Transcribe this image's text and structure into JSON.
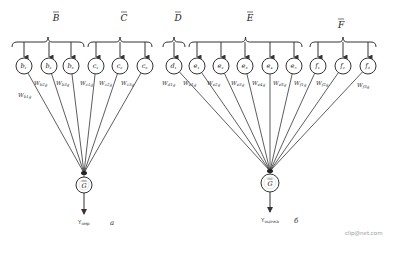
{
  "panels": [
    {
      "id": "a",
      "panel_label": "а",
      "groups": [
        {
          "label": "B",
          "brace": [
            12,
            84
          ],
          "label_x": 56,
          "label_y": 21,
          "nodes": [
            {
              "label": "b₁",
              "x": 24,
              "weight": "W_b1g",
              "wx": 18,
              "wy": 97
            },
            {
              "label": "b₂",
              "x": 49,
              "weight": "W_b2g",
              "wx": 34,
              "wy": 85
            },
            {
              "label": "b₃",
              "x": 71,
              "weight": "W_b3g",
              "wx": 56,
              "wy": 85
            }
          ]
        },
        {
          "label": "C",
          "brace": [
            88,
            152
          ],
          "label_x": 124,
          "label_y": 21,
          "nodes": [
            {
              "label": "c₁",
              "x": 96,
              "weight": "W_c1g",
              "wx": 80,
              "wy": 85
            },
            {
              "label": "c₂",
              "x": 120,
              "weight": "W_c2g",
              "wx": 99,
              "wy": 85
            },
            {
              "label": "c₃",
              "x": 145,
              "weight": "W_c3g",
              "wx": 121,
              "wy": 85
            }
          ]
        }
      ],
      "target": {
        "label": "G",
        "x": 84,
        "y": 185,
        "r": 8,
        "converge_y": 173
      },
      "output": {
        "label": "Y_омр",
        "x": 78,
        "y": 224
      },
      "panel_x": 110,
      "panel_y": 225
    },
    {
      "id": "b",
      "panel_label": "б",
      "groups": [
        {
          "label": "D",
          "brace": [
            163,
            185
          ],
          "label_x": 178,
          "label_y": 21,
          "nodes": [
            {
              "label": "d₁",
              "x": 174,
              "weight": "W_d1g",
              "wx": 162,
              "wy": 85
            }
          ]
        },
        {
          "label": "E",
          "brace": [
            189,
            302
          ],
          "label_x": 250,
          "label_y": 21,
          "nodes": [
            {
              "label": "e₁",
              "x": 197,
              "weight": "W_e1g",
              "wx": 183,
              "wy": 85
            },
            {
              "label": "e₂",
              "x": 221,
              "weight": "W_e2g",
              "wx": 207,
              "wy": 85
            },
            {
              "label": "e₃",
              "x": 245,
              "weight": "W_e3g",
              "wx": 231,
              "wy": 85
            },
            {
              "label": "e₄",
              "x": 270,
              "weight": "W_e4g",
              "wx": 252,
              "wy": 85
            },
            {
              "label": "e₅",
              "x": 294,
              "weight": "W_e5g",
              "wx": 273,
              "wy": 85
            }
          ]
        },
        {
          "label": "F",
          "brace": [
            310,
            376
          ],
          "label_x": 341,
          "label_y": 28,
          "nodes": [
            {
              "label": "f₁",
              "x": 318,
              "weight": "W_f1g",
              "wx": 294,
              "wy": 85
            },
            {
              "label": "f₂",
              "x": 343,
              "weight": "W_f2g",
              "wx": 316,
              "wy": 85
            },
            {
              "label": "f₃",
              "x": 368,
              "weight": "W_f3g",
              "wx": 357,
              "wy": 87
            }
          ]
        }
      ],
      "target": {
        "label": "G",
        "x": 270,
        "y": 183,
        "r": 9,
        "converge_y": 171
      },
      "output": {
        "label": "Y_оцінка",
        "x": 261,
        "y": 222
      },
      "panel_x": 294,
      "panel_y": 223
    }
  ],
  "node_row_y": 66,
  "node_radius": 8,
  "watermark": "clip@net.com"
}
